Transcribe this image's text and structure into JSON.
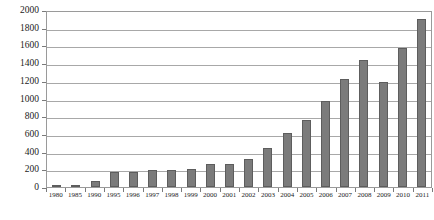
{
  "chart_data": {
    "type": "bar",
    "title": "",
    "xlabel": "",
    "ylabel": "",
    "ylim": [
      0,
      2000
    ],
    "y_ticks": [
      0,
      200,
      400,
      600,
      800,
      1000,
      1200,
      1400,
      1600,
      1800,
      2000
    ],
    "grid": true,
    "legend": false,
    "bar_color": "#7b7b7b",
    "bar_border_color": "#5d5d5d",
    "plot_border_color": "#9a9a9a",
    "gridline_color": "#a8a8a8",
    "categories": [
      "1980",
      "1985",
      "1990",
      "1995",
      "1996",
      "1997",
      "1998",
      "1999",
      "2000",
      "2001",
      "2002",
      "2003",
      "2004",
      "2005",
      "2006",
      "2007",
      "2008",
      "2009",
      "2010",
      "2011"
    ],
    "values": [
      10,
      25,
      70,
      170,
      165,
      195,
      195,
      200,
      255,
      265,
      320,
      440,
      605,
      760,
      970,
      1215,
      1430,
      1190,
      1570,
      1900
    ]
  }
}
